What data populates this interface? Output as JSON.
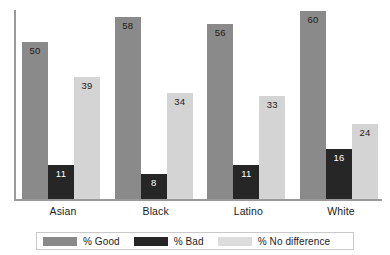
{
  "chart_data": {
    "type": "bar",
    "title": "",
    "subtitle": "",
    "xlabel": "",
    "ylabel": "",
    "categories": [
      "Asian",
      "Black",
      "Latino",
      "White"
    ],
    "series": [
      {
        "name": "% Good",
        "color": "#8a8a8a",
        "values": [
          50,
          58,
          56,
          60
        ]
      },
      {
        "name": "% Bad",
        "color": "#262626",
        "values": [
          11,
          8,
          11,
          16
        ]
      },
      {
        "name": "% No difference",
        "color": "#d4d4d4",
        "values": [
          39,
          34,
          33,
          24
        ]
      }
    ],
    "ylim": [
      0,
      61
    ],
    "grid": false,
    "value_labels": true,
    "legend_position": "bottom",
    "axis_color": "#9a9a9a",
    "background": "#ffffff"
  },
  "legend": {
    "items": [
      {
        "label": "% Good"
      },
      {
        "label": "% Bad"
      },
      {
        "label": "% No difference"
      }
    ]
  }
}
